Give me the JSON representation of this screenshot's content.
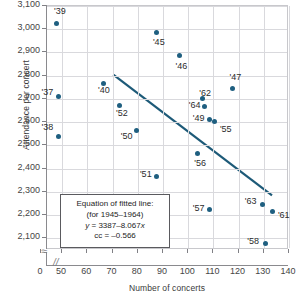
{
  "chart_data": {
    "type": "scatter",
    "title": "",
    "xlabel": "Number of concerts",
    "ylabel": "Attendance per concert",
    "xlim": [
      44,
      140
    ],
    "ylim": [
      2050,
      3100
    ],
    "xticks": [
      "0",
      "50",
      "60",
      "70",
      "80",
      "90",
      "100",
      "110",
      "120",
      "130",
      "140"
    ],
    "yticks": [
      "3,100",
      "3,000",
      "2,900",
      "2,800",
      "2,700",
      "2,600",
      "2,500",
      "2,400",
      "2,300",
      "2,200",
      "2,100"
    ],
    "grid": true,
    "legend": "none",
    "axis_break_x": true,
    "axis_break_y": true,
    "points": [
      {
        "label": "'39",
        "x": 48,
        "y": 3020,
        "lx": -2,
        "ly": -12
      },
      {
        "label": "'37",
        "x": 49,
        "y": 2705,
        "lx": -17,
        "ly": -4
      },
      {
        "label": "'38",
        "x": 49,
        "y": 2533,
        "lx": -17,
        "ly": -9
      },
      {
        "label": "'40",
        "x": 67,
        "y": 2762,
        "lx": -6,
        "ly": 7
      },
      {
        "label": "'52",
        "x": 73,
        "y": 2668,
        "lx": -3,
        "ly": 9
      },
      {
        "label": "'50",
        "x": 80,
        "y": 2562,
        "lx": -16,
        "ly": 7
      },
      {
        "label": "'51",
        "x": 88,
        "y": 2360,
        "lx": -17,
        "ly": -2
      },
      {
        "label": "'45",
        "x": 88,
        "y": 2980,
        "lx": -4,
        "ly": 10
      },
      {
        "label": "'46",
        "x": 97,
        "y": 2882,
        "lx": -4,
        "ly": 11
      },
      {
        "label": "'56",
        "x": 104,
        "y": 2460,
        "lx": -3,
        "ly": 10
      },
      {
        "label": "'62",
        "x": 106,
        "y": 2697,
        "lx": -3,
        "ly": -5
      },
      {
        "label": "'64",
        "x": 107,
        "y": 2665,
        "lx": -16,
        "ly": 0
      },
      {
        "label": "'49",
        "x": 109,
        "y": 2608,
        "lx": -17,
        "ly": 0
      },
      {
        "label": "'55",
        "x": 111,
        "y": 2597,
        "lx": 5,
        "ly": 8
      },
      {
        "label": "'57",
        "x": 109,
        "y": 2218,
        "lx": -17,
        "ly": -1
      },
      {
        "label": "'47",
        "x": 118,
        "y": 2740,
        "lx": -3,
        "ly": -11
      },
      {
        "label": "'63",
        "x": 130,
        "y": 2242,
        "lx": -18,
        "ly": -2
      },
      {
        "label": "'58",
        "x": 131,
        "y": 2075,
        "lx": -18,
        "ly": -1
      },
      {
        "label": "'61",
        "x": 134,
        "y": 2210,
        "lx": 5,
        "ly": 4
      }
    ],
    "fit_line": {
      "x_start": 70.5,
      "y_start": 2802,
      "x_end": 134,
      "y_end": 2278,
      "color": "#1d5a78"
    },
    "annotation": {
      "line1": "Equation of fitted line:",
      "line2": "(for 1945–1964)",
      "line3_prefix": "y",
      "line3_body": " = 3387–8.067",
      "line3_suffix": "x",
      "line4": "cc = –0.566"
    }
  },
  "colors": {
    "point": "#1f5f80",
    "line": "#1d5a78",
    "grid": "#d9d9dd",
    "axis": "#8a8a8e"
  }
}
